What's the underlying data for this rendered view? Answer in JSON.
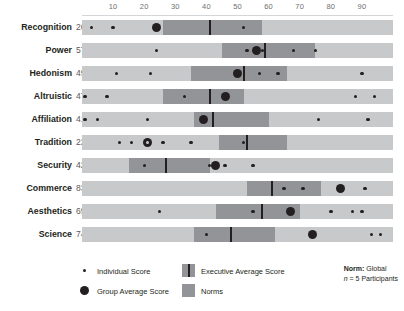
{
  "chart_data": {
    "type": "bar",
    "title": "",
    "xlabel": "",
    "ylabel": "",
    "xlim": [
      0,
      100
    ],
    "grid": false,
    "axis_ticks": [
      10,
      20,
      30,
      40,
      50,
      60,
      70,
      80,
      90
    ],
    "legend_position": "bottom",
    "categories": [
      "Recognition",
      "Power",
      "Hedonism",
      "Altruistic",
      "Affiliation",
      "Tradition",
      "Security",
      "Commerce",
      "Aesthetics",
      "Science"
    ],
    "series": [
      {
        "name": "Group Average Score",
        "values": [
          26,
          57,
          49,
          47,
          41,
          22,
          42,
          83,
          69,
          74
        ]
      }
    ],
    "rows": [
      {
        "label": "Recognition",
        "score": 26,
        "norm_range": [
          26,
          58
        ],
        "executive_average": 41,
        "group_average": 24,
        "individual_scores": [
          3,
          10,
          52
        ]
      },
      {
        "label": "Power",
        "score": 57,
        "norm_range": [
          45,
          75
        ],
        "executive_average": 59,
        "group_average": 56,
        "individual_scores": [
          24,
          53,
          58,
          68,
          75
        ]
      },
      {
        "label": "Hedonism",
        "score": 49,
        "norm_range": [
          35,
          66
        ],
        "executive_average": 52,
        "group_average": 50,
        "individual_scores": [
          11,
          22,
          57,
          63,
          90
        ]
      },
      {
        "label": "Altruistic",
        "score": 47,
        "norm_range": [
          26,
          52
        ],
        "executive_average": 41,
        "group_average": 46,
        "individual_scores": [
          1,
          8,
          33,
          88,
          94
        ]
      },
      {
        "label": "Affiliation",
        "score": 41,
        "norm_range": [
          36,
          60
        ],
        "executive_average": 42,
        "group_average": 39,
        "individual_scores": [
          1,
          5,
          21,
          76,
          92
        ]
      },
      {
        "label": "Tradition",
        "score": 22,
        "norm_range": [
          44,
          66
        ],
        "executive_average": 53,
        "group_average": 21,
        "individual_scores": [
          12,
          16,
          21,
          26,
          35,
          52
        ]
      },
      {
        "label": "Security",
        "score": 42,
        "norm_range": [
          15,
          41
        ],
        "executive_average": 27,
        "group_average": 43,
        "individual_scores": [
          20,
          41,
          46,
          55
        ]
      },
      {
        "label": "Commerce",
        "score": 83,
        "norm_range": [
          53,
          77
        ],
        "executive_average": 61,
        "group_average": 83,
        "individual_scores": [
          65,
          71,
          91
        ]
      },
      {
        "label": "Aesthetics",
        "score": 69,
        "norm_range": [
          43,
          70
        ],
        "executive_average": 58,
        "group_average": 67,
        "individual_scores": [
          25,
          55,
          80,
          87,
          90
        ]
      },
      {
        "label": "Science",
        "score": 74,
        "norm_range": [
          36,
          62
        ],
        "executive_average": 48,
        "group_average": 74,
        "individual_scores": [
          40,
          93,
          96
        ]
      }
    ]
  },
  "legend": {
    "items": [
      {
        "key": "individual-score",
        "label": "Individual Score",
        "swatch": "small-dot"
      },
      {
        "key": "group-average-score",
        "label": "Group Average Score",
        "swatch": "large-dot"
      },
      {
        "key": "executive-average-score",
        "label": "Executive Average Score",
        "swatch": "norms-with-line"
      },
      {
        "key": "norms",
        "label": "Norms",
        "swatch": "norms-block"
      }
    ],
    "norm_note": {
      "title": "Norm:",
      "value": "Global",
      "n_label": "n",
      "n_text": "= 5 Participants"
    }
  },
  "colors": {
    "track": "#c8c9cb",
    "norms": "#929497",
    "marker": "#231f20",
    "tick_text": "#6d6e71",
    "score_text": "#58595b",
    "background": "#ffffff"
  }
}
